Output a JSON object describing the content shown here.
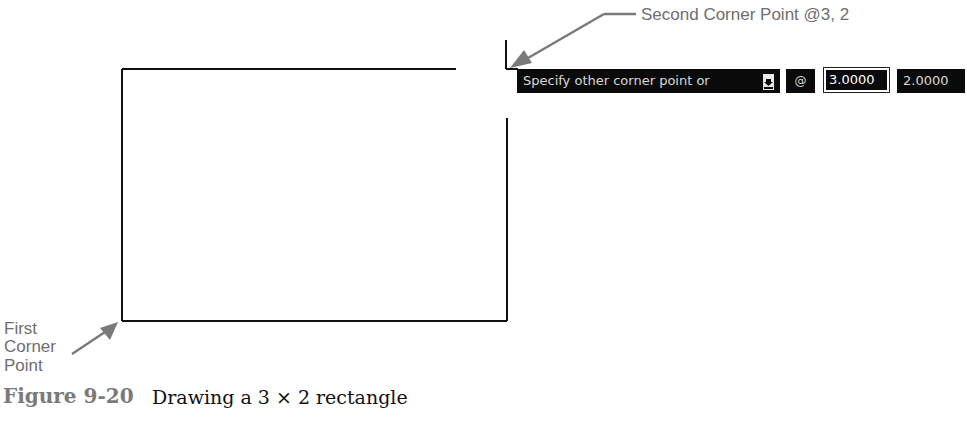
{
  "drawing": {
    "rectangle": {
      "x": 122,
      "y": 69,
      "width": 385,
      "height": 252,
      "stroke": "#111111"
    },
    "cursor": {
      "x": 506,
      "y": 69
    }
  },
  "callouts": {
    "second_corner": "Second Corner Point @3, 2",
    "first_corner_line1": "First",
    "first_corner_line2": "Corner",
    "first_corner_line3": "Point",
    "color": "#6e6e6e"
  },
  "dynamic_input": {
    "prompt": "Specify other corner point or",
    "options_icon": "down-arrow-icon",
    "relative_symbol": "@",
    "x_value": "3.0000",
    "y_value": "2.0000"
  },
  "caption": {
    "label": "Figure 9-20",
    "text": "Drawing a 3 × 2 rectangle"
  }
}
